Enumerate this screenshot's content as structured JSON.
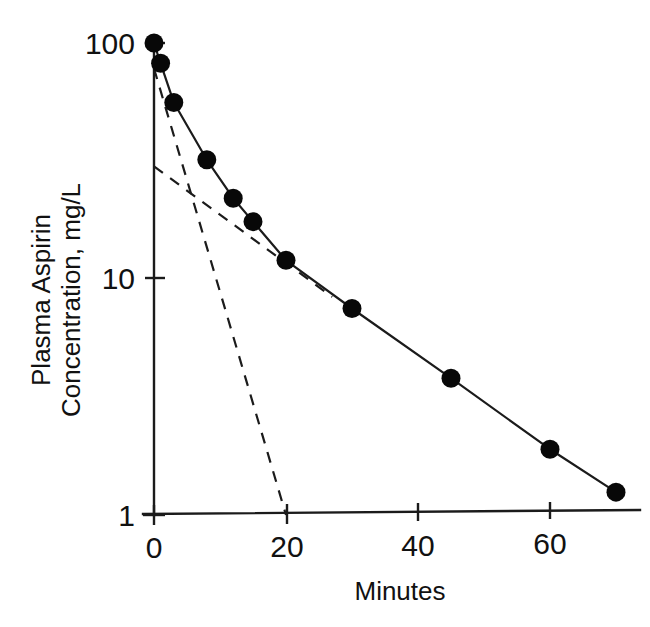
{
  "chart_data": {
    "type": "line",
    "title": "",
    "subtitle": "",
    "xlabel": "Minutes",
    "ylabel": "Plasma Aspirin Concentration, mg/L",
    "ylabel_line1": "Plasma Aspirin",
    "ylabel_line2": "Concentration, mg/L",
    "yscale": "log",
    "xscale": "linear",
    "xlim": [
      0,
      74
    ],
    "ylim": [
      1,
      100
    ],
    "xticks": [
      0,
      20,
      40,
      60
    ],
    "xtick_labels": [
      "0",
      "20",
      "40",
      "60"
    ],
    "yticks": [
      1,
      10,
      100
    ],
    "ytick_labels": [
      "1",
      "10",
      "100"
    ],
    "grid": false,
    "legend": null,
    "marker": "filled-circle",
    "series": [
      {
        "name": "Plasma aspirin concentration",
        "style": "solid-with-markers",
        "x": [
          0,
          1,
          3,
          8,
          12,
          15,
          20,
          30,
          45,
          60,
          70
        ],
        "values": [
          100,
          82,
          56,
          32,
          22,
          17.5,
          12,
          7.5,
          3.8,
          1.9,
          1.25
        ]
      },
      {
        "name": "Distribution phase extrapolation",
        "style": "dashed",
        "x": [
          0,
          20
        ],
        "values": [
          78,
          1.0
        ]
      },
      {
        "name": "Elimination phase extrapolation",
        "style": "dashed",
        "x": [
          0,
          27
        ],
        "values": [
          30,
          8.4
        ]
      }
    ],
    "annotations": []
  },
  "axes": {
    "x_title": "Minutes",
    "y_title_line1": "Plasma Aspirin",
    "y_title_line2": "Concentration, mg/L",
    "x_tick_0": "0",
    "x_tick_1": "20",
    "x_tick_2": "40",
    "x_tick_3": "60",
    "y_tick_0": "1",
    "y_tick_1": "10",
    "y_tick_2": "100"
  },
  "colors": {
    "ink": "#1b1b1b",
    "marker": "#080808",
    "background": "#ffffff"
  }
}
